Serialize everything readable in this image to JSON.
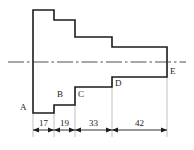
{
  "drawing": {
    "type": "stepped-shaft-section",
    "background_color": "#ffffff",
    "line_color": "#1c1c1c",
    "extension_line_color": "#a8a8a8",
    "axis_color": "#3a3a3a",
    "point_labels": [
      {
        "id": "A",
        "text": "A",
        "x": 20,
        "y": 108
      },
      {
        "id": "B",
        "text": "B",
        "x": 57,
        "y": 95
      },
      {
        "id": "C",
        "text": "C",
        "x": 78,
        "y": 95
      },
      {
        "id": "D",
        "text": "D",
        "x": 115,
        "y": 84
      },
      {
        "id": "E",
        "text": "E",
        "x": 170,
        "y": 72
      }
    ],
    "dimensions": [
      {
        "id": "d1",
        "text": "17",
        "from": 33,
        "to": 54,
        "center": 43.5
      },
      {
        "id": "d2",
        "text": "19",
        "from": 54,
        "to": 75,
        "center": 64.5
      },
      {
        "id": "d3",
        "text": "33",
        "from": 75,
        "to": 112,
        "center": 93.5
      },
      {
        "id": "d4",
        "text": "42",
        "from": 112,
        "to": 167,
        "center": 139.5
      }
    ],
    "dim_line_y": 130,
    "dim_text_y": 119,
    "profile_path": "M 33 10 L 54 10 L 54 20 L 75 20 L 75 37 L 112 37 L 112 47 L 167 47 L 167 77 L 112 77 L 112 87 L 75 87 L 75 105 L 54 105 L 54 113 L 33 113 Z",
    "center_axis": {
      "y": 62,
      "x1": 8,
      "x2": 186,
      "dash_pattern": "16 3 2.5 3"
    },
    "extension_lines": [
      {
        "x": 33,
        "y1": 113,
        "y2": 137
      },
      {
        "x": 54,
        "y1": 105,
        "y2": 137
      },
      {
        "x": 75,
        "y1": 87,
        "y2": 137
      },
      {
        "x": 112,
        "y1": 77,
        "y2": 137
      },
      {
        "x": 167,
        "y1": 47,
        "y2": 137
      }
    ]
  }
}
